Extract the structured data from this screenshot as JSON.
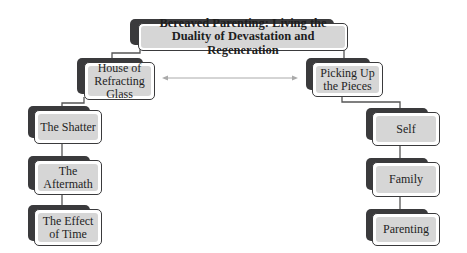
{
  "diagram": {
    "title": "Bereaved Parenting: Living the Duality of Devastation and Regeneration",
    "branches": [
      {
        "label": "House of Refracting Glass",
        "children": [
          "The Shatter",
          "The Aftermath",
          "The Effect of Time"
        ]
      },
      {
        "label": "Picking Up the Pieces",
        "children": [
          "Self",
          "Family",
          "Parenting"
        ]
      }
    ],
    "connector": "bidirectional-arrow between branches",
    "colors": {
      "box_shadow": "#3a3a3c",
      "box_fill": "#d6d6d6",
      "box_border": "#3a3a3c",
      "line": "#555555",
      "arrow": "#aaaaaa"
    }
  }
}
